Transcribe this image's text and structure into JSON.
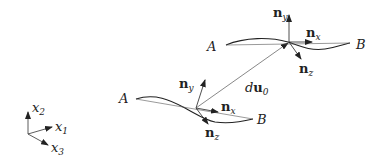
{
  "diagram": {
    "type": "vector-kinematics",
    "coordinate_axes": {
      "x1": {
        "base": "x",
        "sub": "1"
      },
      "x2": {
        "base": "x",
        "sub": "2"
      },
      "x3": {
        "base": "x",
        "sub": "3"
      }
    },
    "lower_frame": {
      "point_a": "A",
      "point_b": "B",
      "nx": {
        "base": "n",
        "sub": "x"
      },
      "ny": {
        "base": "n",
        "sub": "y"
      },
      "nz": {
        "base": "n",
        "sub": "z"
      }
    },
    "upper_frame": {
      "point_a": "A",
      "point_b": "B",
      "nx": {
        "base": "n",
        "sub": "x"
      },
      "ny": {
        "base": "n",
        "sub": "y"
      },
      "nz": {
        "base": "n",
        "sub": "z"
      }
    },
    "displacement": {
      "d": "d",
      "u": "u",
      "sub": "0"
    },
    "colors": {
      "stroke": "#222222",
      "thin": "#555555",
      "background": "#ffffff"
    }
  }
}
